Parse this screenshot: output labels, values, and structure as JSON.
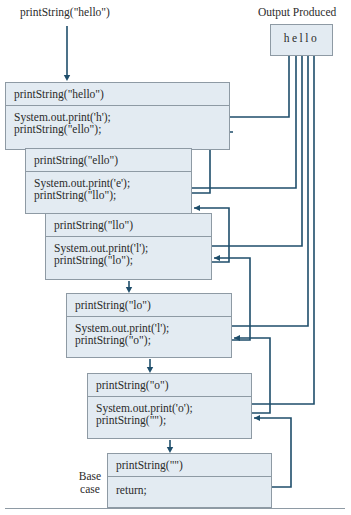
{
  "initial_call": "printString(\"hello\")",
  "output": {
    "title": "Output Produced",
    "text": "hello"
  },
  "frames": [
    {
      "header": "printString(\"hello\")",
      "lines": [
        "System.out.print('h');",
        "printString(\"ello\");"
      ]
    },
    {
      "header": "printString(\"ello\")",
      "lines": [
        "System.out.print('e');",
        "printString(\"llo\");"
      ]
    },
    {
      "header": "printString(\"llo\")",
      "lines": [
        "System.out.print('l');",
        "printString(\"lo\");"
      ]
    },
    {
      "header": "printString(\"lo\")",
      "lines": [
        "System.out.print('l');",
        "printString(\"o\");"
      ]
    },
    {
      "header": "printString(\"o\")",
      "lines": [
        "System.out.print('o');",
        "printString(\"\");"
      ]
    },
    {
      "header": "printString(\"\")",
      "lines": [
        "return;"
      ]
    }
  ],
  "base_case_label": "Base\ncase",
  "base_case_label_lines": [
    "Base",
    "case"
  ],
  "colors": {
    "line": "#1f4e6b",
    "box_fill": "#e3ebf2",
    "box_border": "#8e9aa4"
  }
}
